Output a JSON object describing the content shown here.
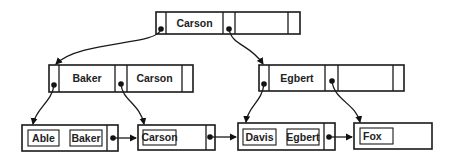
{
  "diagram": {
    "type": "b-plus-tree",
    "root": {
      "keys": [
        "Carson"
      ]
    },
    "internal": [
      {
        "keys": [
          "Baker",
          "Carson"
        ]
      },
      {
        "keys": [
          "Egbert"
        ]
      }
    ],
    "leaves": [
      {
        "keys": [
          "Able",
          "Baker"
        ]
      },
      {
        "keys": [
          "Carson"
        ]
      },
      {
        "keys": [
          "Davis",
          "Egbert"
        ]
      },
      {
        "keys": [
          "Fox"
        ]
      }
    ],
    "colors": {
      "stroke": "#1a1a1a",
      "background": "#ffffff"
    }
  }
}
